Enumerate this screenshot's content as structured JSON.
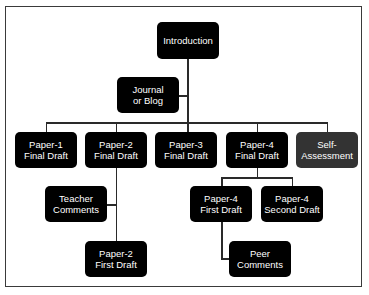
{
  "diagram": {
    "colors": {
      "node": "#000000",
      "node_alt": "#333333",
      "line": "#2a2a2a",
      "frame": "#3a3a3a"
    },
    "nodes": {
      "introduction": "Introduction",
      "journal": "Journal\nor Blog",
      "paper1_final": "Paper-1\nFinal Draft",
      "paper2_final": "Paper-2\nFinal Draft",
      "paper3_final": "Paper-3\nFinal Draft",
      "paper4_final": "Paper-4\nFinal Draft",
      "self_assessment": "Self-\nAssessment",
      "teacher_comments": "Teacher\nComments",
      "paper2_first": "Paper-2\nFirst Draft",
      "paper4_first": "Paper-4\nFirst Draft",
      "paper4_second": "Paper-4\nSecond Draft",
      "peer_comments": "Peer\nComments"
    },
    "edges": [
      [
        "introduction",
        "journal"
      ],
      [
        "introduction",
        "paper1_final"
      ],
      [
        "introduction",
        "paper2_final"
      ],
      [
        "introduction",
        "paper3_final"
      ],
      [
        "introduction",
        "paper4_final"
      ],
      [
        "introduction",
        "self_assessment"
      ],
      [
        "paper2_final",
        "teacher_comments"
      ],
      [
        "paper2_final",
        "paper2_first"
      ],
      [
        "paper4_final",
        "paper4_first"
      ],
      [
        "paper4_final",
        "paper4_second"
      ],
      [
        "paper4_first",
        "peer_comments"
      ]
    ]
  }
}
